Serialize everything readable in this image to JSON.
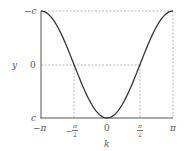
{
  "chart_data": {
    "type": "line",
    "title": "",
    "xlabel": "k",
    "ylabel": "y",
    "function": "y = c·cos(k) (plotted with −c at top, c at bottom)",
    "xlim": [
      "-π",
      "π"
    ],
    "ylim_labels_top_to_bottom": [
      "-c",
      "0",
      "c"
    ],
    "x_ticks": [
      "-π",
      "-π/2",
      "0",
      "π/2",
      "π"
    ],
    "y_ticks": [
      "-c",
      "0",
      "c"
    ],
    "series": [
      {
        "name": "curve",
        "x": [
          -3.1416,
          -2.356,
          -1.5708,
          -0.7854,
          0,
          0.7854,
          1.5708,
          2.356,
          3.1416
        ],
        "y_relative": [
          -1,
          -0.707,
          0,
          0.707,
          1,
          0.707,
          0,
          -0.707,
          -1
        ]
      }
    ],
    "reference_lines": {
      "horizontal_dashed": [
        "-c",
        "0"
      ],
      "vertical_dashed": [
        "-π/2",
        "π/2",
        "π"
      ]
    },
    "grid": false,
    "legend": null
  },
  "labels": {
    "y_axis": "y",
    "x_axis": "k",
    "y_top": "−c",
    "y_mid": "0",
    "y_bottom": "c",
    "x_neg_pi": "−π",
    "x_neg_half_sign": "−",
    "x_half_num": "π",
    "x_half_den": "2",
    "x_zero": "0",
    "x_pi": "π"
  },
  "colors": {
    "curve": "#333333",
    "axes": "#555555",
    "dashed": "#999999"
  }
}
